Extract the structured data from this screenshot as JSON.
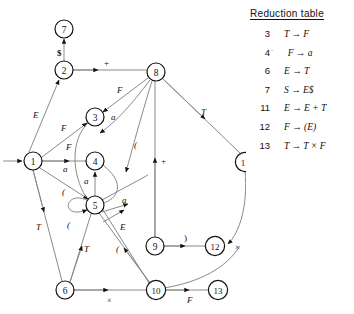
{
  "diagram": {
    "type": "state-transition-graph",
    "start_marker": "arrow-into-node-1",
    "nodes": [
      {
        "id": "1",
        "cx": 33,
        "cy": 161
      },
      {
        "id": "2",
        "cx": 64,
        "cy": 70
      },
      {
        "id": "3",
        "cx": 95,
        "cy": 117
      },
      {
        "id": "4",
        "cx": 95,
        "cy": 161
      },
      {
        "id": "5",
        "cx": 95,
        "cy": 205
      },
      {
        "id": "6",
        "cx": 65,
        "cy": 290
      },
      {
        "id": "7",
        "cx": 64,
        "cy": 29
      },
      {
        "id": "8",
        "cx": 156,
        "cy": 72
      },
      {
        "id": "9",
        "cx": 155,
        "cy": 246
      },
      {
        "id": "10",
        "cx": 156,
        "cy": 290
      },
      {
        "id": "11",
        "cx": 245,
        "cy": 162
      },
      {
        "id": "12",
        "cx": 215,
        "cy": 246
      },
      {
        "id": "13",
        "cx": 218,
        "cy": 290
      }
    ],
    "edges": [
      {
        "from": "1",
        "to": "2",
        "label": "E"
      },
      {
        "from": "2",
        "to": "7",
        "label": "$"
      },
      {
        "from": "2",
        "to": "8",
        "label": "+"
      },
      {
        "from": "1",
        "to": "3",
        "label": "F"
      },
      {
        "from": "1",
        "to": "4",
        "label": "F"
      },
      {
        "from": "1",
        "to": "4b",
        "label": "a"
      },
      {
        "from": "1",
        "to": "5",
        "label": "("
      },
      {
        "from": "1",
        "to": "6",
        "label": "T"
      },
      {
        "from": "8",
        "to": "3",
        "label": "F"
      },
      {
        "from": "8",
        "to": "4",
        "label": "a"
      },
      {
        "from": "8",
        "to": "5",
        "label": "("
      },
      {
        "from": "9",
        "to": "8",
        "label": "+"
      },
      {
        "from": "8",
        "to": "11",
        "label": "T"
      },
      {
        "from": "5",
        "to": "4",
        "label": "a"
      },
      {
        "from": "5",
        "to": "5",
        "label": "(",
        "self_loop": true
      },
      {
        "from": "5",
        "to": "9",
        "label": "a"
      },
      {
        "from": "5",
        "to": "10",
        "label": "E"
      },
      {
        "from": "6",
        "to": "5",
        "label": "T"
      },
      {
        "from": "10",
        "to": "5",
        "label": "("
      },
      {
        "from": "9",
        "to": "12",
        "label": ")"
      },
      {
        "from": "11",
        "to": "12",
        "label": "×"
      },
      {
        "from": "6",
        "to": "10",
        "label": "×"
      },
      {
        "from": "10",
        "to": "13",
        "label": "F"
      }
    ]
  },
  "table": {
    "title": "Reduction table",
    "columns": [
      "number",
      "rule"
    ],
    "rows": [
      {
        "number": "3",
        "prime": "",
        "rule": "T → F"
      },
      {
        "number": "4",
        "prime": "˙",
        "rule": "F → a"
      },
      {
        "number": "6",
        "prime": "",
        "rule": "E → T"
      },
      {
        "number": "7",
        "prime": "",
        "rule": "S → E$",
        "bold_tail": "$"
      },
      {
        "number": "11",
        "prime": "",
        "rule": "E → E + T"
      },
      {
        "number": "12",
        "prime": "",
        "rule": "F → (E)"
      },
      {
        "number": "13",
        "prime": "",
        "rule": "T → T × F"
      }
    ]
  },
  "caption": "",
  "colors": {
    "line": "#8a8a8a",
    "node_stroke": "#111111",
    "text": "#111111",
    "background": "#ffffff"
  }
}
